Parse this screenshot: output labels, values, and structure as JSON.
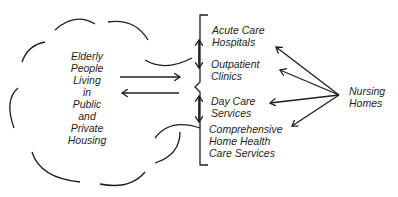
{
  "diagram": {
    "center_node": {
      "lines": [
        "Elderly",
        "People",
        "Living",
        "in",
        "Public",
        "and",
        "Private",
        "Housing"
      ]
    },
    "services": [
      {
        "lines": [
          "Acute Care",
          "Hospitals"
        ]
      },
      {
        "lines": [
          "Outpatient",
          "Clinics"
        ]
      },
      {
        "lines": [
          "Day Care",
          "Services"
        ]
      },
      {
        "lines": [
          "Comprehensive",
          "Home Health",
          "Care Services"
        ]
      }
    ],
    "right_node": {
      "lines": [
        "Nursing",
        "Homes"
      ]
    },
    "colors": {
      "ink": "#1e1e1e",
      "background": "#ffffff"
    }
  }
}
